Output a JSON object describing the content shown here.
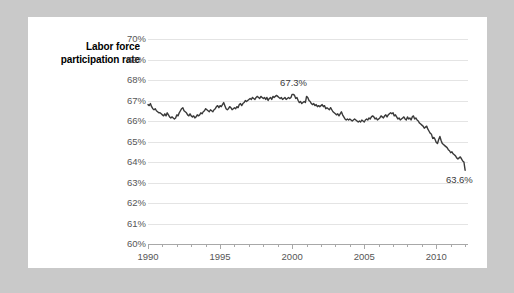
{
  "chart_data": {
    "type": "line",
    "title": "",
    "ylabel": "Labor force participation rate",
    "xlabel": "",
    "ylim": [
      60,
      70
    ],
    "xlim": [
      1990,
      2012.2
    ],
    "grid": true,
    "legend": "none",
    "line_color": "#3a3a3a",
    "ytick_labels": [
      "70%",
      "69%",
      "68%",
      "67%",
      "66%",
      "65%",
      "64%",
      "63%",
      "62%",
      "61%",
      "60%"
    ],
    "ytick_values": [
      70,
      69,
      68,
      67,
      66,
      65,
      64,
      63,
      62,
      61,
      60
    ],
    "xtick_labels": [
      "1990",
      "1995",
      "2000",
      "2005",
      "2010"
    ],
    "xtick_values": [
      1990,
      1995,
      2000,
      2005,
      2010
    ],
    "xtick_minor_values": [
      1991,
      1992,
      1993,
      1994,
      1996,
      1997,
      1998,
      1999,
      2001,
      2002,
      2003,
      2004,
      2006,
      2007,
      2008,
      2009,
      2011,
      2012
    ],
    "annotations": [
      {
        "label": "67.3%",
        "x": 2000.1,
        "y": 67.85
      },
      {
        "label": "63.6%",
        "x": 2011.6,
        "y": 63.1
      }
    ],
    "x": [
      1990.0,
      1990.083,
      1990.167,
      1990.25,
      1990.333,
      1990.417,
      1990.5,
      1990.583,
      1990.667,
      1990.75,
      1990.833,
      1990.917,
      1991.0,
      1991.083,
      1991.167,
      1991.25,
      1991.333,
      1991.417,
      1991.5,
      1991.583,
      1991.667,
      1991.75,
      1991.833,
      1991.917,
      1992.0,
      1992.083,
      1992.167,
      1992.25,
      1992.333,
      1992.417,
      1992.5,
      1992.583,
      1992.667,
      1992.75,
      1992.833,
      1992.917,
      1993.0,
      1993.083,
      1993.167,
      1993.25,
      1993.333,
      1993.417,
      1993.5,
      1993.583,
      1993.667,
      1993.75,
      1993.833,
      1993.917,
      1994.0,
      1994.083,
      1994.167,
      1994.25,
      1994.333,
      1994.417,
      1994.5,
      1994.583,
      1994.667,
      1994.75,
      1994.833,
      1994.917,
      1995.0,
      1995.083,
      1995.167,
      1995.25,
      1995.333,
      1995.417,
      1995.5,
      1995.583,
      1995.667,
      1995.75,
      1995.833,
      1995.917,
      1996.0,
      1996.083,
      1996.167,
      1996.25,
      1996.333,
      1996.417,
      1996.5,
      1996.583,
      1996.667,
      1996.75,
      1996.833,
      1996.917,
      1997.0,
      1997.083,
      1997.167,
      1997.25,
      1997.333,
      1997.417,
      1997.5,
      1997.583,
      1997.667,
      1997.75,
      1997.833,
      1997.917,
      1998.0,
      1998.083,
      1998.167,
      1998.25,
      1998.333,
      1998.417,
      1998.5,
      1998.583,
      1998.667,
      1998.75,
      1998.833,
      1998.917,
      1999.0,
      1999.083,
      1999.167,
      1999.25,
      1999.333,
      1999.417,
      1999.5,
      1999.583,
      1999.667,
      1999.75,
      1999.833,
      1999.917,
      2000.0,
      2000.083,
      2000.167,
      2000.25,
      2000.333,
      2000.417,
      2000.5,
      2000.583,
      2000.667,
      2000.75,
      2000.833,
      2000.917,
      2001.0,
      2001.083,
      2001.167,
      2001.25,
      2001.333,
      2001.417,
      2001.5,
      2001.583,
      2001.667,
      2001.75,
      2001.833,
      2001.917,
      2002.0,
      2002.083,
      2002.167,
      2002.25,
      2002.333,
      2002.417,
      2002.5,
      2002.583,
      2002.667,
      2002.75,
      2002.833,
      2002.917,
      2003.0,
      2003.083,
      2003.167,
      2003.25,
      2003.333,
      2003.417,
      2003.5,
      2003.583,
      2003.667,
      2003.75,
      2003.833,
      2003.917,
      2004.0,
      2004.083,
      2004.167,
      2004.25,
      2004.333,
      2004.417,
      2004.5,
      2004.583,
      2004.667,
      2004.75,
      2004.833,
      2004.917,
      2005.0,
      2005.083,
      2005.167,
      2005.25,
      2005.333,
      2005.417,
      2005.5,
      2005.583,
      2005.667,
      2005.75,
      2005.833,
      2005.917,
      2006.0,
      2006.083,
      2006.167,
      2006.25,
      2006.333,
      2006.417,
      2006.5,
      2006.583,
      2006.667,
      2006.75,
      2006.833,
      2006.917,
      2007.0,
      2007.083,
      2007.167,
      2007.25,
      2007.333,
      2007.417,
      2007.5,
      2007.583,
      2007.667,
      2007.75,
      2007.833,
      2007.917,
      2008.0,
      2008.083,
      2008.167,
      2008.25,
      2008.333,
      2008.417,
      2008.5,
      2008.583,
      2008.667,
      2008.75,
      2008.833,
      2008.917,
      2009.0,
      2009.083,
      2009.167,
      2009.25,
      2009.333,
      2009.417,
      2009.5,
      2009.583,
      2009.667,
      2009.75,
      2009.833,
      2009.917,
      2010.0,
      2010.083,
      2010.167,
      2010.25,
      2010.333,
      2010.417,
      2010.5,
      2010.583,
      2010.667,
      2010.75,
      2010.833,
      2010.917,
      2011.0,
      2011.083,
      2011.167,
      2011.25,
      2011.333,
      2011.417,
      2011.5,
      2011.583,
      2011.667,
      2011.75,
      2011.833,
      2011.917,
      2012.0
    ],
    "values": [
      66.8,
      66.75,
      66.85,
      66.7,
      66.6,
      66.55,
      66.6,
      66.5,
      66.45,
      66.4,
      66.4,
      66.35,
      66.3,
      66.25,
      66.35,
      66.25,
      66.4,
      66.3,
      66.2,
      66.15,
      66.2,
      66.15,
      66.1,
      66.15,
      66.3,
      66.25,
      66.4,
      66.5,
      66.6,
      66.65,
      66.5,
      66.45,
      66.4,
      66.3,
      66.25,
      66.35,
      66.25,
      66.2,
      66.25,
      66.15,
      66.2,
      66.3,
      66.25,
      66.3,
      66.4,
      66.35,
      66.45,
      66.5,
      66.6,
      66.55,
      66.5,
      66.45,
      66.55,
      66.5,
      66.45,
      66.55,
      66.6,
      66.7,
      66.75,
      66.65,
      66.75,
      66.7,
      66.8,
      66.9,
      66.75,
      66.6,
      66.55,
      66.6,
      66.7,
      66.65,
      66.55,
      66.6,
      66.65,
      66.6,
      66.7,
      66.65,
      66.8,
      66.85,
      66.75,
      66.85,
      66.9,
      67.0,
      66.95,
      67.0,
      67.05,
      67.1,
      67.05,
      67.15,
      67.1,
      67.05,
      67.15,
      67.2,
      67.15,
      67.1,
      67.2,
      67.15,
      67.1,
      67.15,
      67.05,
      67.15,
      67.0,
      67.1,
      67.15,
      67.05,
      67.2,
      67.15,
      67.2,
      67.25,
      67.2,
      67.15,
      67.1,
      67.15,
      67.05,
      67.1,
      67.15,
      67.05,
      67.1,
      67.15,
      67.1,
      67.15,
      67.3,
      67.3,
      67.25,
      67.1,
      67.15,
      67.0,
      66.9,
      66.95,
      66.85,
      66.9,
      66.95,
      66.9,
      67.2,
      67.15,
      67.0,
      66.95,
      66.85,
      66.8,
      66.85,
      66.75,
      66.8,
      66.7,
      66.75,
      66.7,
      66.75,
      66.8,
      66.7,
      66.75,
      66.6,
      66.65,
      66.6,
      66.55,
      66.65,
      66.55,
      66.45,
      66.4,
      66.35,
      66.3,
      66.35,
      66.25,
      66.35,
      66.45,
      66.3,
      66.2,
      66.1,
      66.05,
      66.1,
      66.05,
      66.1,
      66.05,
      66.0,
      66.05,
      66.1,
      66.05,
      66.0,
      65.95,
      66.0,
      65.95,
      66.05,
      66.0,
      65.95,
      66.05,
      66.1,
      66.05,
      66.15,
      66.1,
      66.2,
      66.25,
      66.2,
      66.1,
      66.15,
      66.05,
      66.1,
      66.15,
      66.25,
      66.2,
      66.15,
      66.25,
      66.3,
      66.2,
      66.3,
      66.35,
      66.4,
      66.35,
      66.4,
      66.25,
      66.3,
      66.2,
      66.1,
      66.15,
      66.05,
      66.1,
      66.15,
      66.2,
      66.1,
      66.05,
      66.2,
      66.1,
      66.15,
      66.05,
      66.2,
      66.25,
      66.1,
      66.15,
      66.05,
      66.0,
      65.9,
      65.85,
      65.8,
      65.75,
      65.65,
      65.7,
      65.75,
      65.6,
      65.5,
      65.4,
      65.35,
      65.15,
      65.2,
      65.1,
      64.95,
      64.9,
      65.1,
      65.25,
      65.05,
      64.9,
      64.85,
      64.8,
      64.75,
      64.7,
      64.6,
      64.55,
      64.45,
      64.5,
      64.4,
      64.35,
      64.3,
      64.2,
      64.15,
      64.2,
      64.25,
      64.15,
      64.05,
      64.0,
      63.6
    ]
  }
}
